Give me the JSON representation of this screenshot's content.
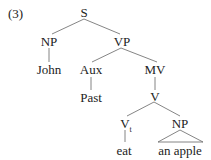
{
  "example_number": "(3)",
  "tree": {
    "S": "S",
    "NP_subject": "NP",
    "VP": "VP",
    "John": "John",
    "Aux": "Aux",
    "MV": "MV",
    "Past": "Past",
    "V": "V",
    "Vt_base": "V",
    "Vt_sub": "t",
    "NP_object": "NP",
    "eat": "eat",
    "an_apple": "an apple"
  },
  "colors": {
    "text": "#222222",
    "line": "#555555",
    "background": "#ffffff"
  }
}
